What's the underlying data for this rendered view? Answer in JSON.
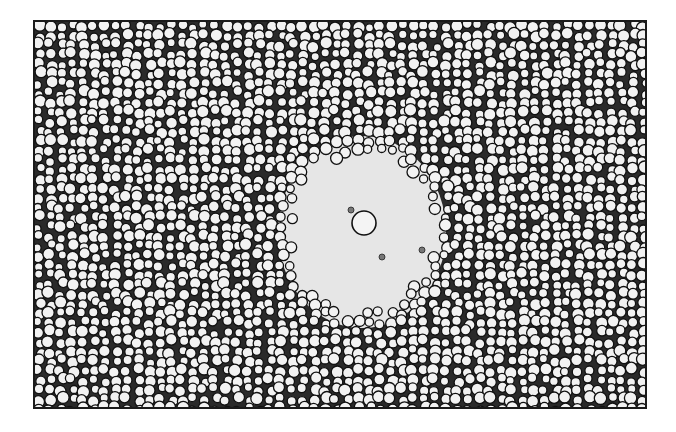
{
  "image": {
    "kind": "micrograph",
    "subject": "dense monolayer of round cells with a central cleared zone",
    "grayscale": true,
    "frame": {
      "x": 33,
      "y": 20,
      "width": 610,
      "height": 385,
      "border_color": "#1a1a1a"
    },
    "colors": {
      "background_gap": "#2a2a2a",
      "cell_fill": "#f2f2f2",
      "cell_rim": "#111111",
      "clear_zone": "#e6e6e6"
    },
    "clear_zone": {
      "cx": 360,
      "cy": 230,
      "rx": 78,
      "ry": 90
    },
    "central_cell": {
      "cx": 362,
      "cy": 221,
      "r": 12
    },
    "small_cells": [
      {
        "cx": 349,
        "cy": 208,
        "r": 3
      },
      {
        "cx": 380,
        "cy": 255,
        "r": 3
      },
      {
        "cx": 420,
        "cy": 248,
        "r": 3
      }
    ]
  }
}
